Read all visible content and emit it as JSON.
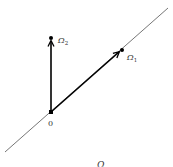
{
  "diagram": {
    "type": "vector-diagram",
    "colors": {
      "line": "#666666",
      "vector": "#000000",
      "text": "#333333"
    },
    "line": {
      "x1": 5,
      "y1": 152,
      "x2": 168,
      "y2": 8
    },
    "origin": {
      "x": 51,
      "y": 112,
      "label": "0"
    },
    "points": [
      {
        "id": "omega1",
        "label": "Ω",
        "subscript": "1",
        "x": 122,
        "y": 50
      },
      {
        "id": "omega2",
        "label": "Ω",
        "subscript": "2",
        "x": 51,
        "y": 38
      }
    ],
    "vectors": [
      {
        "from": "origin",
        "to": "omega2"
      },
      {
        "from": "origin",
        "to": "omega1"
      }
    ],
    "bottom_label": {
      "text": "Ω",
      "x": 97,
      "y": 168
    }
  }
}
